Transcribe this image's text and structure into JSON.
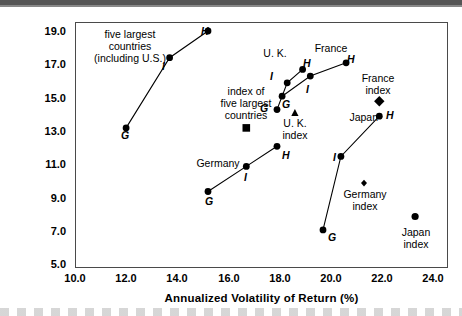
{
  "chart_data": {
    "type": "scatter",
    "title": "",
    "xlabel": "Annualized Volatility of Return (%)",
    "ylabel": "Annualized Total Return (%)",
    "xlim": [
      10.0,
      24.0
    ],
    "ylim": [
      5.0,
      19.0
    ],
    "xticks": [
      "10.0",
      "12.0",
      "14.0",
      "16.0",
      "18.0",
      "20.0",
      "22.0",
      "24.0"
    ],
    "yticks": [
      "19.0",
      "17.0",
      "15.0",
      "13.0",
      "11.0",
      "9.0",
      "7.0",
      "5.0"
    ],
    "grid": false,
    "legend": "none (inline annotations)",
    "series": [
      {
        "name": "five largest countries (including U.S.)",
        "marker": "circle",
        "connected": true,
        "points": [
          {
            "label": "G",
            "x": 12.0,
            "y": 13.2
          },
          {
            "label": "I",
            "x": 13.7,
            "y": 17.4
          },
          {
            "label": "H",
            "x": 15.2,
            "y": 19.0
          }
        ]
      },
      {
        "name": "U. K.",
        "marker": "circle",
        "connected": true,
        "points": [
          {
            "label": "G",
            "x": 17.9,
            "y": 14.3
          },
          {
            "label": "I",
            "x": 18.3,
            "y": 15.9
          },
          {
            "label": "H",
            "x": 18.9,
            "y": 16.7
          }
        ]
      },
      {
        "name": "France",
        "marker": "circle",
        "connected": true,
        "points": [
          {
            "label": "G",
            "x": 18.1,
            "y": 15.1
          },
          {
            "label": "I",
            "x": 19.2,
            "y": 16.3
          },
          {
            "label": "H",
            "x": 20.6,
            "y": 17.1
          }
        ]
      },
      {
        "name": "Germany",
        "marker": "circle",
        "connected": true,
        "points": [
          {
            "label": "G",
            "x": 15.2,
            "y": 9.4
          },
          {
            "label": "I",
            "x": 16.7,
            "y": 10.9
          },
          {
            "label": "H",
            "x": 17.9,
            "y": 12.1
          }
        ]
      },
      {
        "name": "Japan",
        "marker": "circle",
        "connected": true,
        "points": [
          {
            "label": "G",
            "x": 19.7,
            "y": 7.1
          },
          {
            "label": "I",
            "x": 20.4,
            "y": 11.5
          },
          {
            "label": "H",
            "x": 21.9,
            "y": 13.9
          }
        ]
      }
    ],
    "index_markers": [
      {
        "name": "index of five largest countries",
        "marker": "square",
        "x": 16.7,
        "y": 13.2
      },
      {
        "name": "U. K. index",
        "marker": "triangle",
        "x": 18.6,
        "y": 14.1
      },
      {
        "name": "France index",
        "marker": "diamond",
        "x": 21.9,
        "y": 14.8
      },
      {
        "name": "Germany index",
        "marker": "diamond-small",
        "x": 21.3,
        "y": 9.9
      },
      {
        "name": "Japan index",
        "marker": "circle",
        "x": 23.3,
        "y": 7.9
      }
    ],
    "annotations": [
      {
        "id": "five-largest",
        "lines": [
          "five largest",
          "countries",
          "(including U.S.)"
        ]
      },
      {
        "id": "index-five-largest",
        "lines": [
          "index of",
          "five largest",
          "countries"
        ]
      },
      {
        "id": "uk",
        "lines": [
          "U. K."
        ]
      },
      {
        "id": "france",
        "lines": [
          "France"
        ]
      },
      {
        "id": "uk-index",
        "lines": [
          "U. K.",
          "index"
        ]
      },
      {
        "id": "france-index",
        "lines": [
          "France",
          "index"
        ]
      },
      {
        "id": "japan",
        "lines": [
          "Japan"
        ]
      },
      {
        "id": "germany",
        "lines": [
          "Germany"
        ]
      },
      {
        "id": "germany-index",
        "lines": [
          "Germany",
          "index"
        ]
      },
      {
        "id": "japan-index",
        "lines": [
          "Japan",
          "index"
        ]
      }
    ]
  },
  "axes": {
    "ytick_0": "19.0",
    "ytick_1": "17.0",
    "ytick_2": "15.0",
    "ytick_3": "13.0",
    "ytick_4": "11.0",
    "ytick_5": "9.0",
    "ytick_6": "7.0",
    "ytick_7": "5.0",
    "xtick_0": "10.0",
    "xtick_1": "12.0",
    "xtick_2": "14.0",
    "xtick_3": "16.0",
    "xtick_4": "18.0",
    "xtick_5": "20.0",
    "xtick_6": "22.0",
    "xtick_7": "24.0",
    "xlabel": "Annualized Volatility of Return (%)",
    "ylabel": "Annualized Total Return (%)"
  },
  "labels": {
    "G": "G",
    "I": "I",
    "H": "H",
    "five_largest_l1": "five largest",
    "five_largest_l2": "countries",
    "five_largest_l3": "(including U.S.)",
    "index_five_l1": "index of",
    "index_five_l2": "five largest",
    "index_five_l3": "countries",
    "uk": "U. K.",
    "france": "France",
    "uk_index_l1": "U. K.",
    "uk_index_l2": "index",
    "france_index_l1": "France",
    "france_index_l2": "index",
    "japan": "Japan",
    "germany": "Germany",
    "germany_index_l1": "Germany",
    "germany_index_l2": "index",
    "japan_index_l1": "Japan",
    "japan_index_l2": "index"
  },
  "colors": {
    "ink": "#000000",
    "frame": "#4a4a4a",
    "background": "#ffffff"
  }
}
